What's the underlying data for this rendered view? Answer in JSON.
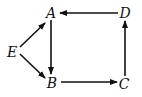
{
  "diagram": {
    "type": "directed-graph",
    "nodes": [
      {
        "id": "A",
        "label": "A",
        "x": 51,
        "y": 14
      },
      {
        "id": "B",
        "label": "B",
        "x": 52,
        "y": 84
      },
      {
        "id": "C",
        "label": "C",
        "x": 124,
        "y": 85
      },
      {
        "id": "D",
        "label": "D",
        "x": 125,
        "y": 14
      },
      {
        "id": "E",
        "label": "E",
        "x": 12,
        "y": 53
      }
    ],
    "edges": [
      {
        "from": "D",
        "to": "A"
      },
      {
        "from": "A",
        "to": "B"
      },
      {
        "from": "B",
        "to": "C"
      },
      {
        "from": "C",
        "to": "D"
      },
      {
        "from": "E",
        "to": "A"
      },
      {
        "from": "E",
        "to": "B"
      }
    ]
  }
}
